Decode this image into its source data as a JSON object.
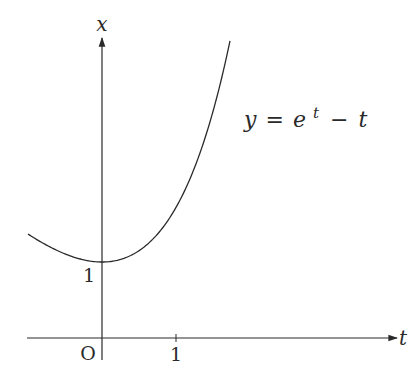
{
  "chart_data": {
    "type": "line",
    "title": "",
    "function": "y = e^t - t",
    "xlabel": "t",
    "ylabel": "x",
    "origin_label": "O",
    "x_ticks": [
      {
        "value": 1,
        "label": "1"
      }
    ],
    "y_ticks": [
      {
        "value": 1,
        "label": "1"
      }
    ],
    "xlim": [
      -1.0,
      4.0
    ],
    "ylim": [
      -0.3,
      4.0
    ],
    "grid": false,
    "legend": "none",
    "annotations": [
      {
        "text": "y = e^t − t",
        "position": "right of curve, upper"
      }
    ],
    "series": [
      {
        "name": "y = e^t - t",
        "x": [
          -1.0,
          -0.5,
          0,
          0.5,
          1.0,
          1.25,
          1.5,
          1.73
        ],
        "values": [
          1.37,
          1.11,
          1.0,
          1.15,
          1.72,
          2.24,
          2.98,
          3.91
        ]
      }
    ]
  },
  "labels": {
    "x_axis": "x",
    "t_axis": "t",
    "origin": "O",
    "tick_t1": "1",
    "tick_x1": "1",
    "formula_y": "y",
    "formula_eq": "=",
    "formula_e": "e",
    "formula_exp": "t",
    "formula_minus": "−",
    "formula_t": "t"
  },
  "colors": {
    "ink": "#2a2a2a"
  }
}
